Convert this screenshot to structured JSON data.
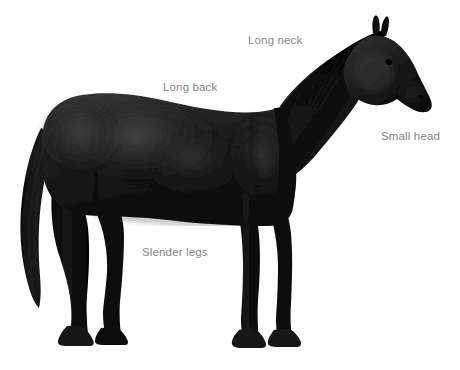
{
  "figure": {
    "view": "side profile facing right",
    "background_color": "#ffffff",
    "label_color": "#848484",
    "body_color": "#1a1a1a"
  },
  "annotations": [
    {
      "id": "long-neck",
      "label": "Long neck",
      "x": 248,
      "y": 35
    },
    {
      "id": "long-back",
      "label": "Long back",
      "x": 163,
      "y": 82
    },
    {
      "id": "small-head",
      "label": "Small head",
      "x": 381,
      "y": 131
    },
    {
      "id": "slender-legs",
      "label": "Slender legs",
      "x": 142,
      "y": 247
    }
  ]
}
